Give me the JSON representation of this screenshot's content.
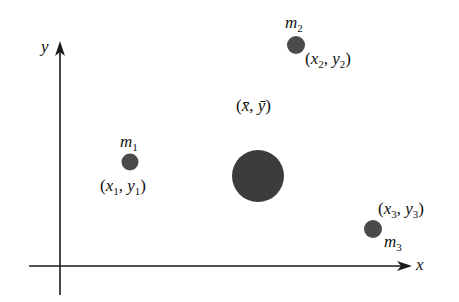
{
  "diagram": {
    "title": "",
    "axes": {
      "x_label": "x",
      "y_label": "y"
    },
    "colors": {
      "axis": "#1a1a1a",
      "mass": "#4a4a4a",
      "center_of_mass": "#3c3c3c",
      "text": "#111111"
    },
    "masses": [
      {
        "name_base": "m",
        "name_sub": "1",
        "coord_x_base": "x",
        "coord_x_sub": "1",
        "coord_y_base": "y",
        "coord_y_sub": "1"
      },
      {
        "name_base": "m",
        "name_sub": "2",
        "coord_x_base": "x",
        "coord_x_sub": "2",
        "coord_y_base": "y",
        "coord_y_sub": "2"
      },
      {
        "name_base": "m",
        "name_sub": "3",
        "coord_x_base": "x",
        "coord_x_sub": "3",
        "coord_y_base": "y",
        "coord_y_sub": "3"
      }
    ],
    "center_of_mass": {
      "coord_x": "x̄",
      "coord_y": "ȳ"
    },
    "punct": {
      "open": "(",
      "close": ")",
      "comma": ", "
    }
  }
}
